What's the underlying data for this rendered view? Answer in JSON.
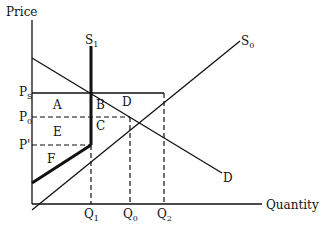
{
  "axes": {
    "y_label": "Price",
    "x_label": "Quantity"
  },
  "curves": {
    "s1": {
      "label": "S",
      "sub": "1"
    },
    "s0": {
      "label": "S",
      "sub": "0"
    },
    "d": {
      "label": "D"
    }
  },
  "price_ticks": {
    "ps": {
      "label": "P",
      "sub": "S"
    },
    "p0": {
      "label": "P",
      "sub": "0"
    },
    "pprime": {
      "label": "P'"
    }
  },
  "quantity_ticks": {
    "q1": {
      "label": "Q",
      "sub": "1"
    },
    "q0": {
      "label": "Q",
      "sub": "0"
    },
    "q2": {
      "label": "Q",
      "sub": "2"
    }
  },
  "regions": {
    "a": "A",
    "b": "B",
    "c": "C",
    "d": "D",
    "e": "E",
    "f": "F"
  },
  "colors": {
    "line": "#111111",
    "background": "#ffffff"
  }
}
